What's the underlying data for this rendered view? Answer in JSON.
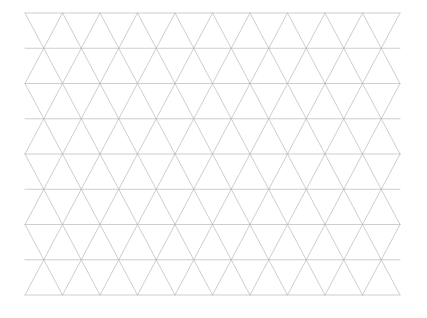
{
  "document": {
    "title": "Triangular Grid",
    "kind": "triangular-lattice-drawing",
    "width": 427,
    "height": 318
  },
  "canvas": {
    "background_color": "#ffffff",
    "width": 427,
    "height": 318
  },
  "chart_data": {
    "type": "line",
    "subtitle": "",
    "xlabel": "",
    "ylabel": "",
    "grid": true,
    "legend_position": "none",
    "annotations": [],
    "tick_labels": [],
    "series": [
      {
        "name": "horizontal-rows",
        "count": 9,
        "values": [
          13,
          48.25,
          83.5,
          118.75,
          154,
          189.25,
          224.5,
          259.75,
          295
        ]
      },
      {
        "name": "diagonal-up-right",
        "count": 19,
        "values": [
          0,
          1,
          2,
          3,
          4,
          5,
          6,
          7,
          8,
          9,
          10,
          11,
          12,
          13,
          14,
          15,
          16,
          17,
          18
        ]
      },
      {
        "name": "diagonal-up-left",
        "count": 19,
        "values": [
          0,
          1,
          2,
          3,
          4,
          5,
          6,
          7,
          8,
          9,
          10,
          11,
          12,
          13,
          14,
          15,
          16,
          17,
          18
        ]
      }
    ]
  },
  "grid": {
    "origin_x": 25,
    "origin_y": 13,
    "right_edge_x": 400,
    "bottom_edge_y": 295,
    "rows": 8,
    "row_height": 35.25,
    "columns": 20,
    "column_pitch": 37.5,
    "half_pitch": 18.75,
    "stroke_color": "#b9b9b9",
    "stroke_width": 0.7,
    "background_color": "#ffffff"
  }
}
